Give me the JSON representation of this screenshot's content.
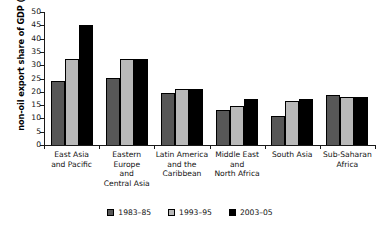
{
  "chart_data": {
    "type": "bar",
    "title": "",
    "subtitle": "",
    "xlabel": "",
    "ylabel": "non-oil export share of GDP (%)",
    "ylim": [
      0,
      50
    ],
    "ytick_step": 5,
    "yticks": [
      0,
      5,
      10,
      15,
      20,
      25,
      30,
      35,
      40,
      45,
      50
    ],
    "ytick_labels": [
      "0",
      "5",
      "10",
      "15",
      "20",
      "25",
      "30",
      "35",
      "40",
      "45",
      "50"
    ],
    "grid": false,
    "legend_position": "bottom-center",
    "categories": [
      "East Asia and Pacific",
      "Eastern Europe and Central Asia",
      "Latin America and the Caribbean",
      "Middle East and North Africa",
      "South Asia",
      "Sub-Saharan Africa"
    ],
    "category_label_lines": [
      [
        "East Asia",
        "and Pacific"
      ],
      [
        "Eastern Europe",
        "and",
        "Central Asia"
      ],
      [
        "Latin America",
        "and the",
        "Caribbean"
      ],
      [
        "Middle East",
        "and",
        "North Africa"
      ],
      [
        "South Asia"
      ],
      [
        "Sub-Saharan",
        "Africa"
      ]
    ],
    "series": [
      {
        "name": "1983–85",
        "color": "#575757",
        "values": [
          24.0,
          25.2,
          19.5,
          13.2,
          10.8,
          18.8
        ]
      },
      {
        "name": "1993–95",
        "color": "#b9b9b9",
        "values": [
          32.5,
          32.4,
          21.2,
          14.7,
          16.5,
          18.0
        ]
      },
      {
        "name": "2003–05",
        "color": "#000000",
        "values": [
          45.0,
          32.4,
          21.2,
          17.3,
          17.4,
          18.0
        ]
      }
    ]
  },
  "legend": {
    "items": [
      {
        "label": "1983–85",
        "color": "#575757"
      },
      {
        "label": "1993–95",
        "color": "#b9b9b9"
      },
      {
        "label": "2003–05",
        "color": "#000000"
      }
    ]
  }
}
